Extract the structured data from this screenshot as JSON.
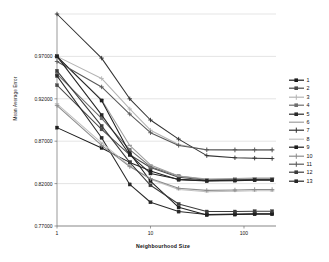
{
  "chart_data": {
    "type": "line",
    "title": "",
    "xlabel": "Neighbourhood Size",
    "ylabel": "Mean Average Error",
    "xscale": "log",
    "xlim": [
      1,
      220
    ],
    "ylim": [
      0.77,
      1.02
    ],
    "grid": true,
    "legend_position": "right",
    "xticks": [
      1,
      10,
      100
    ],
    "xticklabels": [
      "1",
      "10",
      "100"
    ],
    "yticks": [
      0.77,
      0.82,
      0.87,
      0.92,
      0.97
    ],
    "yticklabels": [
      "0.77000",
      "0.82000",
      "0.87000",
      "0.92000",
      "0.97000"
    ],
    "x": [
      1,
      3,
      6,
      10,
      20,
      40,
      80,
      130,
      200
    ],
    "series": [
      {
        "name": "1",
        "color": "#1c1c1c",
        "marker": "square",
        "values": [
          0.886,
          0.862,
          0.845,
          0.835,
          0.8245,
          0.823,
          0.8235,
          0.824,
          0.824
        ]
      },
      {
        "name": "2",
        "color": "#4a4a4a",
        "marker": "square",
        "values": [
          0.936,
          0.884,
          0.854,
          0.839,
          0.8275,
          0.824,
          0.8245,
          0.825,
          0.825
        ]
      },
      {
        "name": "3",
        "color": "#b4b4b4",
        "marker": "plus",
        "values": [
          0.97,
          0.944,
          0.908,
          0.883,
          0.866,
          0.8595,
          0.859,
          0.859,
          0.859
        ]
      },
      {
        "name": "4",
        "color": "#6e6e6e",
        "marker": "square",
        "values": [
          0.949,
          0.897,
          0.86,
          0.84,
          0.829,
          0.8245,
          0.825,
          0.8255,
          0.8255
        ]
      },
      {
        "name": "5",
        "color": "#2a2a2a",
        "marker": "square",
        "values": [
          0.947,
          0.874,
          0.819,
          0.798,
          0.787,
          0.7835,
          0.784,
          0.7845,
          0.7845
        ]
      },
      {
        "name": "6",
        "color": "#9e9e9e",
        "marker": "dash",
        "values": [
          0.969,
          0.919,
          0.865,
          0.842,
          0.829,
          0.8255,
          0.826,
          0.8265,
          0.8265
        ]
      },
      {
        "name": "7",
        "color": "#333333",
        "marker": "plus",
        "values": [
          1.02,
          0.968,
          0.92,
          0.895,
          0.8725,
          0.853,
          0.8505,
          0.85,
          0.8495
        ]
      },
      {
        "name": "8",
        "color": "#c0c0c0",
        "marker": "dash",
        "values": [
          0.914,
          0.868,
          0.841,
          0.825,
          0.813,
          0.8105,
          0.811,
          0.8115,
          0.8115
        ]
      },
      {
        "name": "9",
        "color": "#1f1f1f",
        "marker": "square",
        "values": [
          0.97,
          0.918,
          0.856,
          0.823,
          0.792,
          0.783,
          0.7835,
          0.784,
          0.784
        ]
      },
      {
        "name": "10",
        "color": "#8c8c8c",
        "marker": "plus",
        "values": [
          0.912,
          0.865,
          0.84,
          0.826,
          0.8145,
          0.812,
          0.8125,
          0.813,
          0.813
        ]
      },
      {
        "name": "11",
        "color": "#585858",
        "marker": "plus",
        "values": [
          0.964,
          0.934,
          0.902,
          0.88,
          0.865,
          0.86,
          0.86,
          0.86,
          0.86
        ]
      },
      {
        "name": "12",
        "color": "#3c3c3c",
        "marker": "square",
        "values": [
          0.953,
          0.888,
          0.845,
          0.818,
          0.796,
          0.787,
          0.787,
          0.7875,
          0.7875
        ]
      },
      {
        "name": "13",
        "color": "#262626",
        "marker": "square",
        "values": [
          0.97,
          0.901,
          0.854,
          0.832,
          0.825,
          0.8235,
          0.824,
          0.8245,
          0.8245
        ]
      }
    ]
  },
  "legend": {
    "items": [
      {
        "label": "1"
      },
      {
        "label": "2"
      },
      {
        "label": "3"
      },
      {
        "label": "4"
      },
      {
        "label": "5"
      },
      {
        "label": "6"
      },
      {
        "label": "7"
      },
      {
        "label": "8"
      },
      {
        "label": "9"
      },
      {
        "label": "10"
      },
      {
        "label": "11"
      },
      {
        "label": "12"
      },
      {
        "label": "13"
      }
    ]
  }
}
